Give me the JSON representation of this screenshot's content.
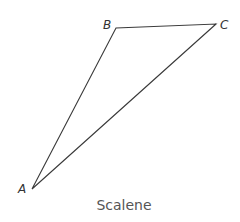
{
  "figure": {
    "caption": "Scalene",
    "line_color": "#3a3a3a",
    "vertices": [
      {
        "label": "A",
        "x": 32,
        "y": 189
      },
      {
        "label": "B",
        "x": 116,
        "y": 28
      },
      {
        "label": "C",
        "x": 216,
        "y": 24
      }
    ],
    "labels": {
      "A": "A",
      "B": "B",
      "C": "C"
    }
  }
}
